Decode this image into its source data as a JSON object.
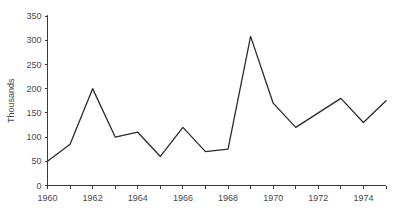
{
  "chart_data": {
    "type": "line",
    "title": "",
    "xlabel": "",
    "ylabel": "Thousands",
    "x": [
      1960,
      1961,
      1962,
      1963,
      1964,
      1965,
      1966,
      1967,
      1968,
      1969,
      1970,
      1971,
      1972,
      1973,
      1974,
      1975
    ],
    "values": [
      50,
      85,
      200,
      100,
      110,
      60,
      120,
      70,
      75,
      308,
      170,
      120,
      150,
      180,
      130,
      175
    ],
    "series": [
      {
        "name": "",
        "values": [
          50,
          85,
          200,
          100,
          110,
          60,
          120,
          70,
          75,
          308,
          170,
          120,
          150,
          180,
          130,
          175
        ]
      }
    ],
    "xlim": [
      1960,
      1975
    ],
    "ylim": [
      0,
      350
    ],
    "y_ticks": [
      0,
      50,
      100,
      150,
      200,
      250,
      300,
      350
    ],
    "y_tick_labels": [
      "0",
      "50",
      "100",
      "150",
      "200",
      "250",
      "300",
      "350"
    ],
    "x_ticks": [
      1960,
      1961,
      1962,
      1963,
      1964,
      1965,
      1966,
      1967,
      1968,
      1969,
      1970,
      1971,
      1972,
      1973,
      1974,
      1975
    ],
    "x_tick_labels": [
      "1960",
      "",
      "1962",
      "",
      "1964",
      "",
      "1966",
      "",
      "1968",
      "",
      "1970",
      "",
      "1972",
      "",
      "1974",
      ""
    ],
    "x_labeled_ticks": [
      {
        "value": 1960,
        "label": "1960"
      },
      {
        "value": 1962,
        "label": "1962"
      },
      {
        "value": 1964,
        "label": "1964"
      },
      {
        "value": 1966,
        "label": "1966"
      },
      {
        "value": 1968,
        "label": "1968"
      },
      {
        "value": 1970,
        "label": "1970"
      },
      {
        "value": 1972,
        "label": "1972"
      },
      {
        "value": 1974,
        "label": "1974"
      }
    ],
    "grid": false,
    "legend": null,
    "legend_position": "none",
    "line_color": "#2b2b2b",
    "axis_color": "#3a3a3a",
    "background_color": "#ffffff"
  }
}
